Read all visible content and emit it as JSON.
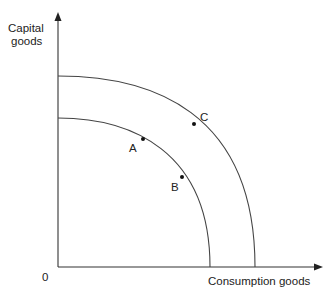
{
  "diagram": {
    "type": "production-possibility-frontier",
    "y_axis_label_line1": "Capital",
    "y_axis_label_line2": "goods",
    "x_axis_label": "Consumption goods",
    "origin_label": "0",
    "curves": [
      {
        "name": "inner-ppf",
        "points_on_curve": [
          "A",
          "B"
        ]
      },
      {
        "name": "outer-ppf",
        "points_on_curve": [
          "C"
        ]
      }
    ],
    "points": [
      {
        "label": "A",
        "curve": "inner"
      },
      {
        "label": "B",
        "curve": "inner"
      },
      {
        "label": "C",
        "curve": "outer"
      }
    ],
    "colors": {
      "line": "#444444",
      "text": "#222222",
      "background": "#ffffff"
    }
  }
}
